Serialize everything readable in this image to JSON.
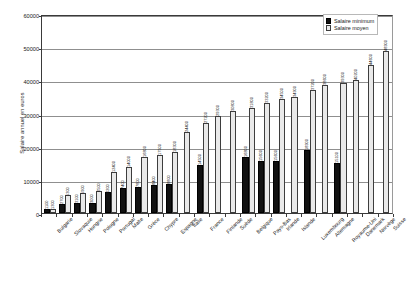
{
  "chart_data": {
    "type": "bar",
    "title": "",
    "xlabel": "",
    "ylabel": "Salaire annuel en euros",
    "ylim": [
      0,
      60000
    ],
    "yticks": [
      0,
      10000,
      20000,
      30000,
      40000,
      50000,
      60000
    ],
    "grid": true,
    "legend_position": "top-right",
    "categories": [
      "Bulgarie",
      "Slovaquie",
      "Hongrie",
      "Pologne",
      "Portugal",
      "Malte",
      "Grèce",
      "Chypre",
      "Espagne",
      "Italie",
      "France",
      "Finlande",
      "Suède",
      "Belgique",
      "Pays-Bas",
      "Irlande",
      "Islande",
      "Luxembourg",
      "Allemagne",
      "Royaume-Uni",
      "Danemark",
      "Norvège",
      "Suisse"
    ],
    "series": [
      {
        "name": "Salaire minimum",
        "pattern": "solid-black",
        "color": "#111111",
        "values": [
          1100,
          2700,
          3100,
          3000,
          6200,
          7400,
          7800,
          8400,
          8800,
          0,
          14500,
          0,
          0,
          16800,
          15600,
          15600,
          0,
          18900,
          0,
          15100,
          0,
          0,
          0
        ]
      },
      {
        "name": "Salaire moyen",
        "pattern": "dotted-hatch",
        "color": "#e9e9e9",
        "values": [
          1300,
          5300,
          5900,
          6500,
          12400,
          14000,
          16800,
          17500,
          18300,
          24400,
          27200,
          29300,
          30800,
          31800,
          33200,
          34500,
          34900,
          37200,
          38600,
          39300,
          40200,
          44600,
          48900
        ]
      }
    ],
    "bar_labels": {
      "Bulgarie": {
        "min": "1100",
        "moyen": "1300"
      },
      "Slovaquie": {
        "min": "2700",
        "moyen": "5300"
      },
      "Hongrie": {
        "min": "3100",
        "moyen": "5900"
      },
      "Pologne": {
        "min": "3000",
        "moyen": "6500"
      },
      "Portugal": {
        "min": "6200",
        "moyen": "12400"
      },
      "Malte": {
        "min": "7400",
        "moyen": "14000"
      },
      "Grèce": {
        "min": "7800",
        "moyen": "16800"
      },
      "Chypre": {
        "min": "8400",
        "moyen": "17500"
      },
      "Espagne": {
        "min": "8800",
        "moyen": "18300"
      },
      "Italie": {
        "min": "",
        "moyen": "24400"
      },
      "France": {
        "min": "14500",
        "moyen": "27200"
      },
      "Finlande": {
        "min": "",
        "moyen": "29300"
      },
      "Suède": {
        "min": "",
        "moyen": "30800"
      },
      "Belgique": {
        "min": "16800",
        "moyen": "31800"
      },
      "Pays-Bas": {
        "min": "15600",
        "moyen": "33200"
      },
      "Irlande": {
        "min": "15600",
        "moyen": "34500"
      },
      "Islande": {
        "min": "",
        "moyen": "34900"
      },
      "Luxembourg": {
        "min": "18900",
        "moyen": "37200"
      },
      "Allemagne": {
        "min": "",
        "moyen": "38600"
      },
      "Royaume-Uni": {
        "min": "15100",
        "moyen": "39300"
      },
      "Danemark": {
        "min": "",
        "moyen": "40200"
      },
      "Norvège": {
        "min": "",
        "moyen": "44600"
      },
      "Suisse": {
        "min": "",
        "moyen": "48900"
      }
    }
  },
  "legend": {
    "items": [
      {
        "label": "Salaire minimum",
        "swatch": "min"
      },
      {
        "label": "Salaire moyen",
        "swatch": "moy"
      }
    ]
  }
}
